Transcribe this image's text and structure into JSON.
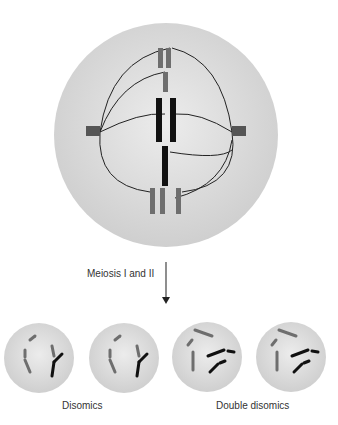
{
  "diagram": {
    "process_label": "Meiosis I and II",
    "groups": [
      {
        "label": "Disomics",
        "cells": 2
      },
      {
        "label": "Double disomics",
        "cells": 2
      }
    ],
    "colors": {
      "cell": "#d8d8d8",
      "gray_chrom": "#6e6e6e",
      "black_chrom": "#111111",
      "spindle": "#222222"
    }
  }
}
